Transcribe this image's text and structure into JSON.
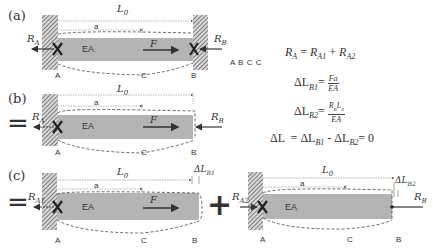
{
  "panels": [
    {
      "label": "(a)",
      "length_label": "L",
      "length_sub": "0",
      "a_label": "a",
      "ea_label": "EA",
      "force_label": "F",
      "left_reaction": "R",
      "left_reaction_sub": "A",
      "right_reaction": "R",
      "right_reaction_sub": "B",
      "point_labels": [
        "A",
        "C",
        "B"
      ],
      "stray_text": "A B C C"
    },
    {
      "label": "(b)",
      "prefix": "=",
      "length_label": "L",
      "length_sub": "0",
      "a_label": "a",
      "ea_label": "EA",
      "force_label": "F",
      "left_reaction": "R",
      "left_reaction_sub": "A",
      "right_reaction": "R",
      "right_reaction_sub": "B",
      "point_labels": [
        "A",
        "C",
        "B"
      ]
    },
    {
      "label": "(c)",
      "prefix": "=",
      "length_label": "L",
      "length_sub": "0",
      "a_label": "a",
      "ea_label": "EA",
      "force_label": "F",
      "left_reaction": "R",
      "left_reaction_sub": "A1",
      "delta_label": "ΔL",
      "delta_sub": "B1",
      "point_labels": [
        "A",
        "C",
        "B"
      ],
      "plus": "+"
    },
    {
      "length_label": "L",
      "length_sub": "0",
      "a_label": "a",
      "ea_label": "EA",
      "left_reaction": "R",
      "left_reaction_sub": "A2",
      "right_reaction": "R",
      "right_reaction_sub": "B",
      "delta_label": "ΔL",
      "delta_sub": "B2",
      "point_labels": [
        "A",
        "C",
        "B"
      ]
    }
  ],
  "equations": {
    "eq1": {
      "lhs": "R",
      "lhs_sub": "A",
      "eq": " = ",
      "t1": "R",
      "t1_sub": "A1",
      "plus": " + ",
      "t2": "R",
      "t2_sub": "A2"
    },
    "eq2": {
      "lhs": "ΔL",
      "lhs_sub": "B1",
      "eq": "=",
      "num": "Fa",
      "den": "EA"
    },
    "eq3": {
      "lhs": "ΔL",
      "lhs_sub": "B2",
      "eq": "=",
      "num": "R_B L_0",
      "num_a": "R",
      "num_a_sub": "B",
      "num_b": "L",
      "num_b_sub": "0",
      "den": "EA"
    },
    "eq4": {
      "lhs": "ΔL",
      "eq": "  = ",
      "t1": "ΔL",
      "t1_sub": "B1",
      "minus": " - ",
      "t2": "ΔL",
      "t2_sub": "B2",
      "rhs": "= 0"
    }
  },
  "colors": {
    "bar_fill": "#b4b4b4",
    "wall_hatch": "#555555",
    "line": "#333333",
    "dashed": "#444444"
  }
}
